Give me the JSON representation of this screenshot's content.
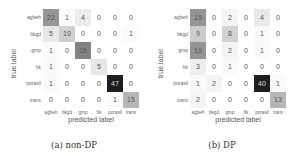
{
  "chart_data": [
    {
      "type": "heatmap",
      "title": "",
      "caption": "(a) non-DP",
      "xlabel": "predicted label",
      "ylabel": "true label",
      "x_categories": [
        "agbeh",
        "bkgd",
        "gmp",
        "hk",
        "porasil",
        "trans"
      ],
      "y_categories": [
        "agbeh",
        "bkgd",
        "gmp",
        "hk",
        "porasil",
        "trans"
      ],
      "values": [
        [
          22,
          1,
          4,
          0,
          0,
          0
        ],
        [
          5,
          10,
          0,
          0,
          0,
          1
        ],
        [
          1,
          0,
          26,
          0,
          0,
          0
        ],
        [
          1,
          0,
          0,
          5,
          0,
          0
        ],
        [
          1,
          0,
          0,
          0,
          47,
          0
        ],
        [
          0,
          0,
          0,
          0,
          1,
          15
        ]
      ],
      "colormap": "greys",
      "vmax": 47
    },
    {
      "type": "heatmap",
      "title": "",
      "caption": "(b) DP",
      "xlabel": "predicted label",
      "ylabel": "true label",
      "x_categories": [
        "agbeh",
        "bkgd",
        "gmp",
        "hk",
        "porasil",
        "trans"
      ],
      "y_categories": [
        "agbeh",
        "bkgd",
        "gmp",
        "hk",
        "porasil",
        "trans"
      ],
      "values": [
        [
          19,
          0,
          2,
          0,
          4,
          0
        ],
        [
          9,
          0,
          8,
          0,
          1,
          0
        ],
        [
          19,
          0,
          2,
          0,
          1,
          0
        ],
        [
          3,
          0,
          1,
          0,
          0,
          0
        ],
        [
          1,
          2,
          0,
          0,
          40,
          1
        ],
        [
          2,
          0,
          0,
          0,
          0,
          13
        ]
      ],
      "colormap": "greys",
      "vmax": 40
    }
  ]
}
